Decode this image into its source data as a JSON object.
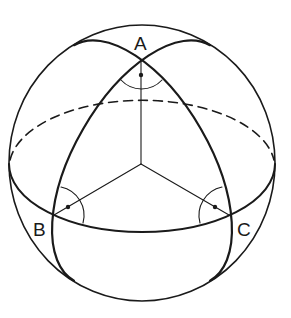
{
  "diagram": {
    "vertices": [
      {
        "label": "A",
        "x": 141,
        "y": 58,
        "angle": "right"
      },
      {
        "label": "B",
        "x": 54,
        "y": 215,
        "angle": "right"
      },
      {
        "label": "C",
        "x": 229,
        "y": 215,
        "angle": "right"
      }
    ],
    "colors": {
      "stroke": "#1a1a1a",
      "background": "#ffffff"
    },
    "elements": [
      "sphere-outline",
      "equator-front",
      "equator-back-dashed",
      "great-circle-left",
      "great-circle-right",
      "radius-OA",
      "radius-OB",
      "radius-OC",
      "right-angle-markers"
    ]
  }
}
